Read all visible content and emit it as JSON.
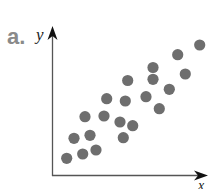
{
  "panel": {
    "label": "a."
  },
  "chart_data": {
    "type": "scatter",
    "title": "",
    "xlabel": "x",
    "ylabel": "y",
    "grid": false,
    "legend": null,
    "ticks": "none",
    "trend": "positive linear correlation",
    "points": [
      {
        "x": 66.7,
        "y": 158.3
      },
      {
        "x": 82.7,
        "y": 154.0
      },
      {
        "x": 96.0,
        "y": 150.0
      },
      {
        "x": 74.0,
        "y": 138.3
      },
      {
        "x": 90.0,
        "y": 135.3
      },
      {
        "x": 85.0,
        "y": 116.7
      },
      {
        "x": 104.0,
        "y": 116.0
      },
      {
        "x": 106.7,
        "y": 98.7
      },
      {
        "x": 120.0,
        "y": 122.0
      },
      {
        "x": 123.3,
        "y": 137.7
      },
      {
        "x": 132.7,
        "y": 125.7
      },
      {
        "x": 125.3,
        "y": 101.0
      },
      {
        "x": 127.7,
        "y": 80.5
      },
      {
        "x": 146.0,
        "y": 96.7
      },
      {
        "x": 159.3,
        "y": 108.7
      },
      {
        "x": 153.0,
        "y": 79.3
      },
      {
        "x": 153.0,
        "y": 67.5
      },
      {
        "x": 169.3,
        "y": 89.3
      },
      {
        "x": 177.7,
        "y": 54.7
      },
      {
        "x": 185.3,
        "y": 74.0
      },
      {
        "x": 199.7,
        "y": 45.0
      }
    ],
    "point_color": "#6e6e6e",
    "axis_color": "#555555"
  }
}
